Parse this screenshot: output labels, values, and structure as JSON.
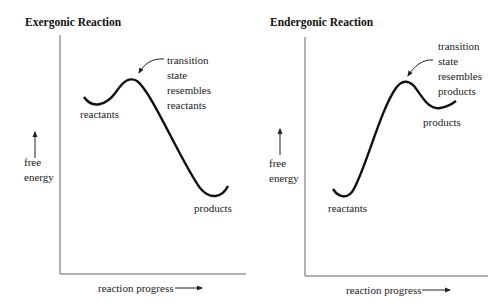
{
  "panels": [
    {
      "title": "Exergonic Reaction",
      "y_label_line1": "free",
      "y_label_line2": "energy",
      "x_label": "reaction progress",
      "reactants_label": "reactants",
      "products_label": "products",
      "ts_note": [
        "transition",
        "state",
        "resembles",
        "reactants"
      ]
    },
    {
      "title": "Endergonic Reaction",
      "y_label_line1": "free",
      "y_label_line2": "energy",
      "x_label": "reaction progress",
      "reactants_label": "reactants",
      "products_label": "products",
      "ts_note": [
        "transition",
        "state",
        "resembles",
        "products"
      ]
    }
  ],
  "colors": {
    "curve": "#111111",
    "axis": "#555555"
  }
}
